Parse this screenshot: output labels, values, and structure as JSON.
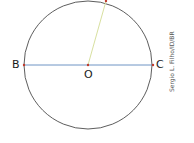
{
  "diagram": {
    "points": {
      "B": {
        "label": "B",
        "x": 24,
        "y": 65
      },
      "O": {
        "label": "O",
        "x": 88,
        "y": 65
      },
      "C": {
        "label": "C",
        "x": 153,
        "y": 65
      },
      "top": {
        "x": 106,
        "y": 1
      }
    },
    "circle": {
      "cx": 88,
      "cy": 65,
      "r": 64,
      "stroke": "#333333"
    },
    "diameter_color": "#4a78b5",
    "radius_color": "#d8e0a0",
    "point_color": "#c0392b",
    "credit": "Sergio L. Filho/ID/BR"
  }
}
